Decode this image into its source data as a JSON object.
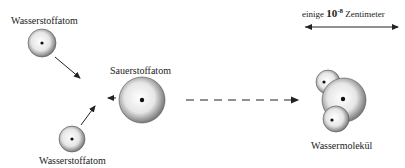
{
  "labels": {
    "hydrogen_top": "Wasserstoffatom",
    "hydrogen_bottom": "Wasserstoffatom",
    "oxygen": "Sauerstoffatom",
    "molecule": "Wassermolekül"
  },
  "scale": {
    "prefix": "einige",
    "base": "10",
    "exponent": "-8",
    "unit": "Zentimeter"
  }
}
